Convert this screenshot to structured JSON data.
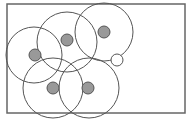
{
  "diagram": {
    "frame": {
      "x": 7,
      "y": 4,
      "width": 178,
      "height": 109,
      "stroke": "#666666"
    },
    "range_circles": [
      {
        "id": "A",
        "cx": 34,
        "cy": 55,
        "r": 28
      },
      {
        "id": "B",
        "cx": 67,
        "cy": 42,
        "r": 30
      },
      {
        "id": "C",
        "cx": 104,
        "cy": 32,
        "r": 29
      },
      {
        "id": "D",
        "cx": 53,
        "cy": 88,
        "r": 30
      },
      {
        "id": "E",
        "cx": 89,
        "cy": 88,
        "r": 30
      }
    ],
    "nodes": [
      {
        "id": "A",
        "cx": 35,
        "cy": 55,
        "r": 6
      },
      {
        "id": "B",
        "cx": 67,
        "cy": 40,
        "r": 6
      },
      {
        "id": "C",
        "cx": 104,
        "cy": 32,
        "r": 6
      },
      {
        "id": "D",
        "cx": 53,
        "cy": 88,
        "r": 6
      },
      {
        "id": "E",
        "cx": 88,
        "cy": 88,
        "r": 6
      }
    ],
    "empty_node": {
      "cx": 117,
      "cy": 60,
      "r": 6
    },
    "colors": {
      "node_fill": "#999999",
      "node_stroke": "#555555",
      "circle_stroke": "#555555",
      "background": "#ffffff"
    }
  }
}
